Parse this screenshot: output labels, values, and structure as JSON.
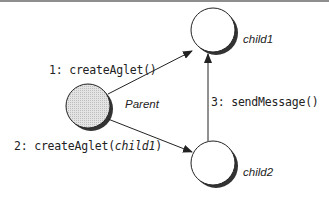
{
  "diagram": {
    "type": "collaboration-diagram",
    "colors": {
      "stroke": "#222222",
      "shadow": "#333333",
      "parent_fill": "#d8d8d8",
      "child_fill": "#ffffff",
      "border": "#8e8e8e"
    },
    "nodes": [
      {
        "id": "parent",
        "label": "Parent",
        "cx": 88,
        "cy": 106,
        "r": 22,
        "filled": true
      },
      {
        "id": "child1",
        "label": "child1",
        "cx": 213,
        "cy": 30,
        "r": 22,
        "filled": false
      },
      {
        "id": "child2",
        "label": "child2",
        "cx": 213,
        "cy": 163,
        "r": 22,
        "filled": false
      }
    ],
    "edges": [
      {
        "from": "parent",
        "to": "child1",
        "label_prefix": "1: createAglet(",
        "label_arg": "",
        "label_suffix": ")"
      },
      {
        "from": "parent",
        "to": "child2",
        "label_prefix": "2: createAglet(",
        "label_arg": "child1",
        "label_suffix": ")"
      },
      {
        "from": "child2",
        "to": "child1",
        "label_prefix": "3: sendMessage(",
        "label_arg": "",
        "label_suffix": ")"
      }
    ]
  }
}
